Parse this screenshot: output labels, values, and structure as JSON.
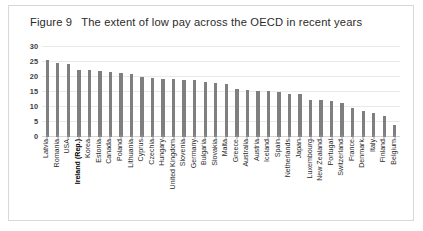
{
  "figure": {
    "number": "Figure 9",
    "title": "The extent of low pay across the OECD in recent years"
  },
  "chart_data": {
    "type": "bar",
    "title": "The extent of low pay across the OECD in recent years",
    "xlabel": "",
    "ylabel": "% of workers",
    "ylim": [
      0,
      30
    ],
    "yticks": [
      0,
      5,
      10,
      15,
      20,
      25,
      30
    ],
    "grid": true,
    "legend": false,
    "bar_color": "#7f7f7f",
    "highlighted_category": "Ireland (Rep.)",
    "categories": [
      "Latvia",
      "Romania",
      "USA",
      "Ireland (Rep.)",
      "Korea",
      "Estonia",
      "Canada",
      "Poland",
      "Lithuania",
      "Cyprus",
      "Czechia",
      "Hungary",
      "United Kingdom",
      "Slovenia",
      "Germany",
      "Bulgaria",
      "Slovakia",
      "Malta",
      "Greece",
      "Australia",
      "Austria",
      "Iceland",
      "Spain",
      "Netherlands",
      "Japan",
      "Luxembourg",
      "New Zealand",
      "Portugal",
      "Switzerland",
      "France",
      "Denmark",
      "Italy",
      "Finland",
      "Belgium"
    ],
    "values": [
      25.6,
      24.7,
      24.4,
      22.4,
      22.3,
      21.9,
      21.8,
      21.4,
      21.1,
      20.0,
      19.8,
      19.5,
      19.3,
      19.0,
      19.0,
      18.4,
      17.9,
      17.7,
      16.1,
      15.6,
      15.5,
      15.2,
      15.0,
      14.4,
      14.2,
      12.3,
      12.2,
      12.0,
      11.3,
      9.6,
      8.6,
      8.0,
      7.0,
      4.0
    ]
  }
}
